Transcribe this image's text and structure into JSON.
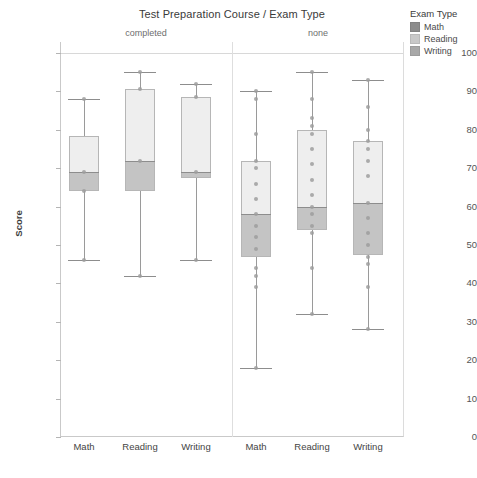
{
  "chart_data": {
    "type": "box",
    "title": "Test Preparation Course / Exam Type",
    "xlabel": "",
    "ylabel": "Score",
    "ylim": [
      0,
      100
    ],
    "ytick_labels": [
      "100",
      "90",
      "80",
      "70",
      "60",
      "50",
      "40",
      "30",
      "20",
      "10",
      "0"
    ],
    "ytick_values": [
      100,
      90,
      80,
      70,
      60,
      50,
      40,
      30,
      20,
      10,
      0
    ],
    "grid": false,
    "legend_position": "right",
    "facets": [
      "completed",
      "none"
    ],
    "categories": [
      "Math",
      "Reading",
      "Writing",
      "Math",
      "Reading",
      "Writing"
    ],
    "legend": {
      "title": "Exam Type",
      "entries": [
        {
          "label": "Math",
          "color": "#8c8c8c"
        },
        {
          "label": "Reading",
          "color": "#c9c9c9"
        },
        {
          "label": "Writing",
          "color": "#a8a8a8"
        }
      ]
    },
    "boxes": [
      {
        "facet": "completed",
        "category": "Math",
        "whisker_low": 46,
        "q1": 64,
        "median": 69,
        "q3": 78.5,
        "whisker_high": 88,
        "points": [
          88,
          69,
          64,
          46
        ]
      },
      {
        "facet": "completed",
        "category": "Reading",
        "whisker_low": 42,
        "q1": 64,
        "median": 72,
        "q3": 90.5,
        "whisker_high": 95,
        "points": [
          95,
          90.5,
          72,
          42
        ]
      },
      {
        "facet": "completed",
        "category": "Writing",
        "whisker_low": 46,
        "q1": 67.5,
        "median": 69,
        "q3": 88.5,
        "whisker_high": 92,
        "points": [
          92,
          88.5,
          69,
          46
        ]
      },
      {
        "facet": "none",
        "category": "Math",
        "whisker_low": 18,
        "q1": 47,
        "median": 58,
        "q3": 72,
        "whisker_high": 90,
        "points": [
          90,
          88,
          79,
          72,
          70,
          66,
          62,
          58,
          55,
          52,
          49,
          44,
          42,
          39,
          18
        ]
      },
      {
        "facet": "none",
        "category": "Reading",
        "whisker_low": 32,
        "q1": 54,
        "median": 60,
        "q3": 80,
        "whisker_high": 95,
        "points": [
          95,
          88,
          83,
          81,
          79,
          75,
          71,
          67,
          63,
          60,
          58,
          55,
          53,
          44,
          32
        ]
      },
      {
        "facet": "none",
        "category": "Writing",
        "whisker_low": 28,
        "q1": 47.5,
        "median": 61,
        "q3": 77,
        "whisker_high": 93,
        "points": [
          93,
          86,
          80,
          77,
          75,
          72,
          68,
          61,
          57,
          53,
          50,
          47,
          45,
          39,
          28
        ]
      }
    ]
  },
  "axis": {
    "y_title": "Score",
    "y_ticks": [
      "100",
      "90",
      "80",
      "70",
      "60",
      "50",
      "40",
      "30",
      "20",
      "10",
      "0"
    ],
    "x_ticks": [
      "Math",
      "Reading",
      "Writing",
      "Math",
      "Reading",
      "Writing"
    ]
  },
  "facets": {
    "left_label": "completed",
    "right_label": "none"
  },
  "legend": {
    "title": "Exam Type",
    "items": [
      {
        "label": "Math",
        "color": "#8c8c8c"
      },
      {
        "label": "Reading",
        "color": "#c9c9c9"
      },
      {
        "label": "Writing",
        "color": "#a8a8a8"
      }
    ]
  },
  "title": "Test Preparation Course / Exam Type"
}
